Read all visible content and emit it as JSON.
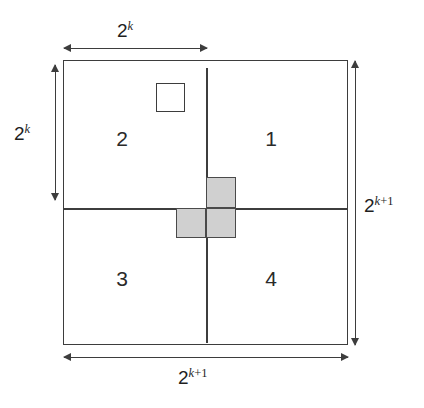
{
  "figure": {
    "type": "geometric-diagram",
    "colors": {
      "line": "#3d3d3d",
      "tromino_fill": "#d0d0d0",
      "tromino_border": "#4a4a4a",
      "background": "#ffffff",
      "text": "#1f1f1f"
    }
  },
  "quadrants": [
    {
      "id": "quadrant-1",
      "label": "1",
      "position": "top-right"
    },
    {
      "id": "quadrant-2",
      "label": "2",
      "position": "top-left"
    },
    {
      "id": "quadrant-3",
      "label": "3",
      "position": "bottom-left"
    },
    {
      "id": "quadrant-4",
      "label": "4",
      "position": "bottom-right"
    }
  ],
  "dimensions": {
    "top": {
      "base": "2",
      "exponent": "k",
      "text": "2^k",
      "side": "top",
      "spans": "half-width"
    },
    "left": {
      "base": "2",
      "exponent": "k",
      "text": "2^k",
      "side": "left",
      "spans": "half-height"
    },
    "right": {
      "base": "2",
      "exponent": "k+1",
      "exponent_var": "k",
      "exponent_rest": "+1",
      "text": "2^(k+1)",
      "side": "right",
      "spans": "full-height"
    },
    "bottom": {
      "base": "2",
      "exponent": "k+1",
      "exponent_var": "k",
      "exponent_rest": "+1",
      "text": "2^(k+1)",
      "side": "bottom",
      "spans": "full-width"
    }
  },
  "shapes": {
    "hole": {
      "name": "defective-square",
      "located_in_quadrant": "2",
      "filled": false
    },
    "tromino": {
      "name": "l-tromino",
      "filled": true,
      "cells": [
        {
          "name": "tromino-cell-top",
          "quadrant": "1"
        },
        {
          "name": "tromino-cell-bottom-left",
          "quadrant": "3"
        },
        {
          "name": "tromino-cell-bottom-right",
          "quadrant": "4"
        }
      ]
    }
  }
}
